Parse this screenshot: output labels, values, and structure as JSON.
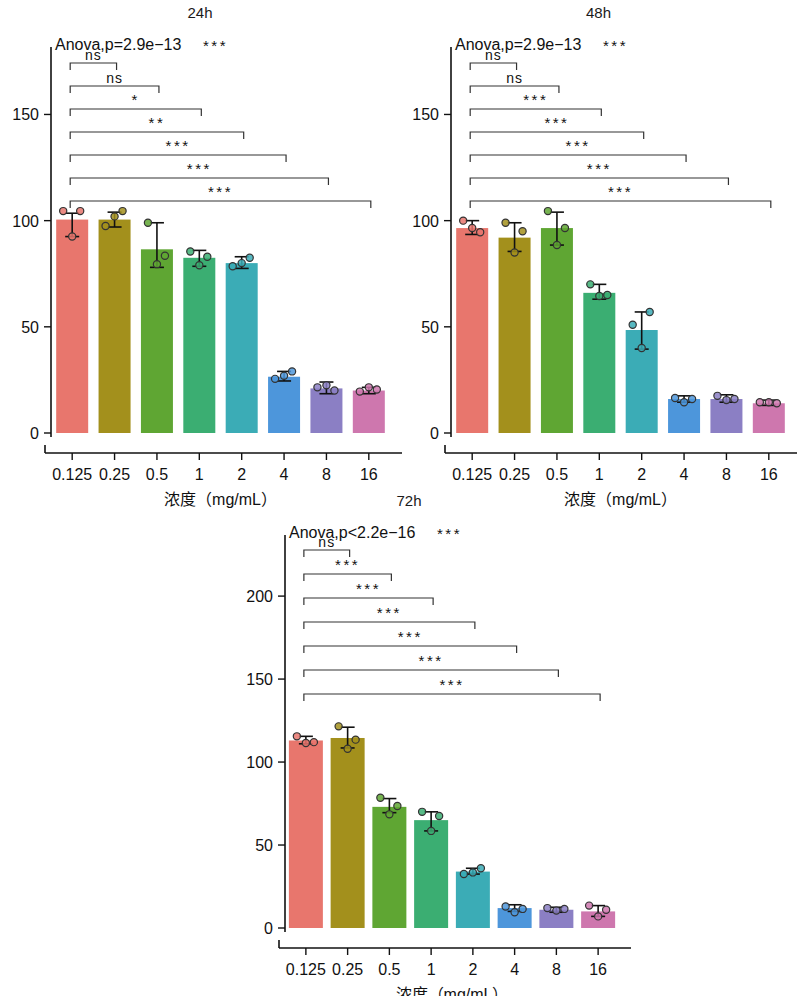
{
  "figure": {
    "x_axis_title": "浓度（mg/mL）",
    "categories": [
      "0.125",
      "0.25",
      "0.5",
      "1",
      "2",
      "4",
      "8",
      "16"
    ],
    "bar_colors": [
      "#E8766D",
      "#A3901C",
      "#5FA633",
      "#3BAE72",
      "#3BACB6",
      "#4D96DB",
      "#8B7FC4",
      "#CE77AE"
    ],
    "point_fill_colors": [
      "#E8766D",
      "#A3901C",
      "#5FA633",
      "#3BAE72",
      "#3BACB6",
      "#4D96DB",
      "#8B7FC4",
      "#CE77AE"
    ]
  },
  "chart_data": [
    {
      "type": "bar",
      "title": "24h",
      "panel_id": "panel-24h",
      "xlabel": "浓度（mg/mL）",
      "ylabel": "",
      "categories": [
        "0.125",
        "0.25",
        "0.5",
        "1",
        "2",
        "4",
        "8",
        "16"
      ],
      "values": [
        100.5,
        100.5,
        86.5,
        82.5,
        80.0,
        26.5,
        21.0,
        20.0
      ],
      "err_low": [
        92.5,
        97.0,
        78.0,
        78.5,
        77.5,
        24.5,
        18.5,
        18.5
      ],
      "err_high": [
        103.5,
        104.0,
        99.0,
        86.0,
        83.0,
        29.0,
        24.0,
        21.5
      ],
      "points": [
        [
          104.5,
          104.5,
          92.5
        ],
        [
          97.5,
          104.5,
          102.0
        ],
        [
          99.0,
          83.5,
          79.5
        ],
        [
          85.5,
          83.0,
          79.0
        ],
        [
          78.5,
          82.5,
          80.0
        ],
        [
          25.5,
          29.0,
          27.0
        ],
        [
          21.5,
          20.0,
          22.5
        ],
        [
          19.5,
          20.5,
          21.5
        ]
      ],
      "yticks": [
        0,
        50,
        100,
        150
      ],
      "ylim": [
        0,
        178
      ],
      "grid": false,
      "annotation": "Anova,p=2.9e−13",
      "annotation_stars": "***",
      "brackets": [
        {
          "from": 0,
          "to": 1,
          "label": "ns"
        },
        {
          "from": 0,
          "to": 2,
          "label": "ns"
        },
        {
          "from": 0,
          "to": 3,
          "label": "*"
        },
        {
          "from": 0,
          "to": 4,
          "label": "**"
        },
        {
          "from": 0,
          "to": 5,
          "label": "***"
        },
        {
          "from": 0,
          "to": 6,
          "label": "***"
        },
        {
          "from": 0,
          "to": 7,
          "label": "***"
        }
      ]
    },
    {
      "type": "bar",
      "title": "48h",
      "panel_id": "panel-48h",
      "xlabel": "浓度（mg/mL）",
      "ylabel": "",
      "categories": [
        "0.125",
        "0.25",
        "0.5",
        "1",
        "2",
        "4",
        "8",
        "16"
      ],
      "values": [
        96.5,
        92.0,
        96.5,
        66.0,
        48.5,
        16.0,
        16.0,
        14.0
      ],
      "err_low": [
        93.5,
        85.5,
        88.5,
        63.0,
        39.5,
        14.5,
        14.5,
        13.0
      ],
      "err_high": [
        100.0,
        99.0,
        104.0,
        70.0,
        57.0,
        17.5,
        18.0,
        15.5
      ],
      "points": [
        [
          100.0,
          94.5,
          96.5
        ],
        [
          99.0,
          95.0,
          85.0
        ],
        [
          104.5,
          96.5,
          88.5
        ],
        [
          70.0,
          65.0,
          64.5
        ],
        [
          51.0,
          57.0,
          40.0
        ],
        [
          16.5,
          16.0,
          14.5
        ],
        [
          17.5,
          16.0,
          15.5
        ],
        [
          14.5,
          14.0,
          14.5
        ]
      ],
      "yticks": [
        0,
        50,
        100,
        150
      ],
      "ylim": [
        0,
        178
      ],
      "grid": false,
      "annotation": "Anova,p=2.9e−13",
      "annotation_stars": "***",
      "brackets": [
        {
          "from": 0,
          "to": 1,
          "label": "ns"
        },
        {
          "from": 0,
          "to": 2,
          "label": "ns"
        },
        {
          "from": 0,
          "to": 3,
          "label": "***"
        },
        {
          "from": 0,
          "to": 4,
          "label": "***"
        },
        {
          "from": 0,
          "to": 5,
          "label": "***"
        },
        {
          "from": 0,
          "to": 6,
          "label": "***"
        },
        {
          "from": 0,
          "to": 7,
          "label": "***"
        }
      ]
    },
    {
      "type": "bar",
      "title": "72h",
      "panel_id": "panel-72h",
      "xlabel": "浓度（mg/mL）",
      "ylabel": "",
      "categories": [
        "0.125",
        "0.25",
        "0.5",
        "1",
        "2",
        "4",
        "8",
        "16"
      ],
      "values": [
        113.0,
        114.5,
        73.0,
        65.0,
        34.0,
        12.0,
        11.0,
        10.0
      ],
      "err_low": [
        111.0,
        108.5,
        69.5,
        58.5,
        32.5,
        10.0,
        9.5,
        7.0
      ],
      "err_high": [
        115.5,
        121.0,
        78.0,
        70.0,
        36.0,
        14.0,
        12.5,
        13.5
      ],
      "points": [
        [
          115.5,
          112.0,
          111.5
        ],
        [
          121.5,
          113.5,
          108.0
        ],
        [
          78.5,
          73.5,
          68.5
        ],
        [
          70.0,
          67.5,
          58.5
        ],
        [
          32.5,
          36.0,
          33.5
        ],
        [
          13.0,
          11.5,
          9.5
        ],
        [
          12.0,
          11.5,
          10.5
        ],
        [
          13.5,
          11.0,
          7.0
        ]
      ],
      "yticks": [
        0,
        50,
        100,
        150,
        200
      ],
      "ylim": [
        0,
        232
      ],
      "grid": false,
      "annotation": "Anova,p<2.2e−16",
      "annotation_stars": "***",
      "brackets": [
        {
          "from": 0,
          "to": 1,
          "label": "ns"
        },
        {
          "from": 0,
          "to": 2,
          "label": "***"
        },
        {
          "from": 0,
          "to": 3,
          "label": "***"
        },
        {
          "from": 0,
          "to": 4,
          "label": "***"
        },
        {
          "from": 0,
          "to": 5,
          "label": "***"
        },
        {
          "from": 0,
          "to": 6,
          "label": "***"
        },
        {
          "from": 0,
          "to": 7,
          "label": "***"
        }
      ]
    }
  ]
}
